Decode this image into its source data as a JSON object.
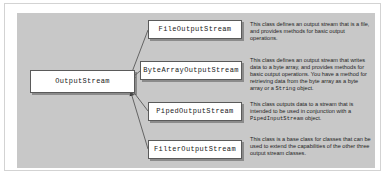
{
  "diagram": {
    "canvas_color": "#c8c8c8",
    "box_fill": "#ffffff",
    "box_border": "#5a5a5a",
    "base_class": {
      "name": "OutputStream"
    },
    "subclasses": [
      {
        "name": "FileOutputStream",
        "description_parts": [
          {
            "type": "text",
            "value": "This class defines an output stream that is a file, and provides methods for basic output operations."
          }
        ]
      },
      {
        "name": "ByteArrayOutputStream",
        "description_parts": [
          {
            "type": "text",
            "value": "This class defines an output stream that writes data to a byte array, and provides methods for basic output operations. You have a method for retrieving data from the byte array as a byte array or a "
          },
          {
            "type": "code",
            "value": "String"
          },
          {
            "type": "text",
            "value": " object."
          }
        ]
      },
      {
        "name": "PipedOutputStream",
        "description_parts": [
          {
            "type": "text",
            "value": "This class outputs data to a stream that is intended to be used in conjunction with a "
          },
          {
            "type": "code",
            "value": "PipedInputStream"
          },
          {
            "type": "text",
            "value": " object."
          }
        ]
      },
      {
        "name": "FilterOutputStream",
        "description_parts": [
          {
            "type": "text",
            "value": "This class is a base class for classes that can be used to extend the capabilities of the other three output stream classes."
          }
        ]
      }
    ],
    "connectors": {
      "style": "solid-line-with-filled-arrowhead",
      "arrow_target": "OutputStream",
      "count": 4
    }
  }
}
